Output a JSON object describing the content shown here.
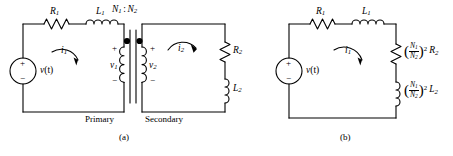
{
  "figure": {
    "type": "circuit-diagram",
    "background": "#ffffff",
    "line_color": "#000000",
    "panels": [
      {
        "id": "a",
        "caption": "(a)",
        "description": "Transformer circuit with primary and secondary meshes",
        "region_labels": {
          "primary": "Primary",
          "secondary": "Secondary"
        },
        "turns_ratio": {
          "n1": "N",
          "n1_sub": "1",
          "sep": ":",
          "n2": "N",
          "n2_sub": "2"
        },
        "components": [
          {
            "name": "R1",
            "letter": "R",
            "sub": "1",
            "kind": "resistor",
            "orientation": "horizontal"
          },
          {
            "name": "L1",
            "letter": "L",
            "sub": "1",
            "kind": "inductor",
            "orientation": "horizontal"
          },
          {
            "name": "R2",
            "letter": "R",
            "sub": "2",
            "kind": "resistor",
            "orientation": "vertical"
          },
          {
            "name": "L2",
            "letter": "L",
            "sub": "2",
            "kind": "inductor",
            "orientation": "vertical"
          },
          {
            "name": "source",
            "letter": "v",
            "arg": "(t)",
            "kind": "voltage-source"
          },
          {
            "name": "primary-coil",
            "kind": "transformer-winding"
          },
          {
            "name": "secondary-coil",
            "kind": "transformer-winding"
          }
        ],
        "voltages": [
          {
            "name": "v1",
            "letter": "v",
            "sub": "1",
            "plus": "+",
            "minus": "−"
          },
          {
            "name": "v2",
            "letter": "v",
            "sub": "2",
            "plus": "+",
            "minus": "−"
          }
        ],
        "mesh_currents": [
          {
            "name": "i1",
            "letter": "i",
            "sub": "1",
            "direction": "clockwise"
          },
          {
            "name": "i2",
            "letter": "i",
            "sub": "2",
            "direction": "clockwise"
          }
        ],
        "source_polarity": {
          "plus": "+",
          "minus": "−"
        },
        "dots": 2
      },
      {
        "id": "b",
        "caption": "(b)",
        "description": "Equivalent single-mesh circuit with reflected secondary impedance",
        "components": [
          {
            "name": "R1",
            "letter": "R",
            "sub": "1",
            "kind": "resistor",
            "orientation": "horizontal"
          },
          {
            "name": "L1",
            "letter": "L",
            "sub": "1",
            "kind": "inductor",
            "orientation": "horizontal"
          },
          {
            "name": "reflected-R2",
            "kind": "resistor",
            "orientation": "vertical",
            "coef": {
              "num_letter": "N",
              "num_sub": "1",
              "den_letter": "N",
              "den_sub": "2",
              "power": "2"
            },
            "letter": "R",
            "sub": "2"
          },
          {
            "name": "reflected-L2",
            "kind": "inductor",
            "orientation": "vertical",
            "coef": {
              "num_letter": "N",
              "num_sub": "1",
              "den_letter": "N",
              "den_sub": "2",
              "power": "2"
            },
            "letter": "L",
            "sub": "2"
          },
          {
            "name": "source",
            "letter": "v",
            "arg": "(t)",
            "kind": "voltage-source"
          }
        ],
        "mesh_currents": [
          {
            "name": "i1",
            "letter": "i",
            "sub": "1",
            "direction": "clockwise"
          }
        ],
        "source_polarity": {
          "plus": "+",
          "minus": "−"
        }
      }
    ]
  }
}
